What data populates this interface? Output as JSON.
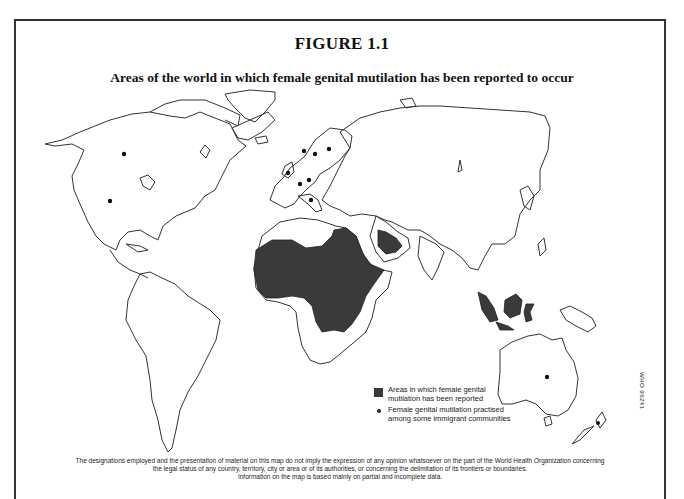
{
  "figure": {
    "label": "FIGURE 1.1",
    "title": "Areas of the world in which female genital mutilation has been reported to occur"
  },
  "legend": {
    "items": [
      {
        "symbol": "dark-shaded-area",
        "text": "Areas in which female genital mutilation has been reported",
        "color": "#3a3a3a"
      },
      {
        "symbol": "black-dot",
        "text": "Female genital mutilation practised among some immigrant communities",
        "color": "#222222"
      }
    ]
  },
  "reference_code": "WHO 96241",
  "footer": {
    "line1": "The designations employed and the presentation of material on this map do not imply the expression of any opinion whatsoever on the part of the World Health Organization concerning",
    "line2": "the legal status of any country, territory, city or area or of its authorities, or concerning the delimitation of its frontiers or boundaries.",
    "line3": "Information on the map is based mainly on partial and incomplete data."
  },
  "map": {
    "shaded_regions": [
      "West Africa",
      "Central Africa",
      "East Africa / Horn of Africa",
      "Egypt",
      "Southern Arabian Peninsula",
      "Malaysia / Indonesia"
    ],
    "immigrant_community_markers": [
      "Canada",
      "United States",
      "United Kingdom",
      "Scandinavia (3)",
      "Western Europe (2)",
      "Italy",
      "Australia",
      "New Zealand"
    ]
  }
}
